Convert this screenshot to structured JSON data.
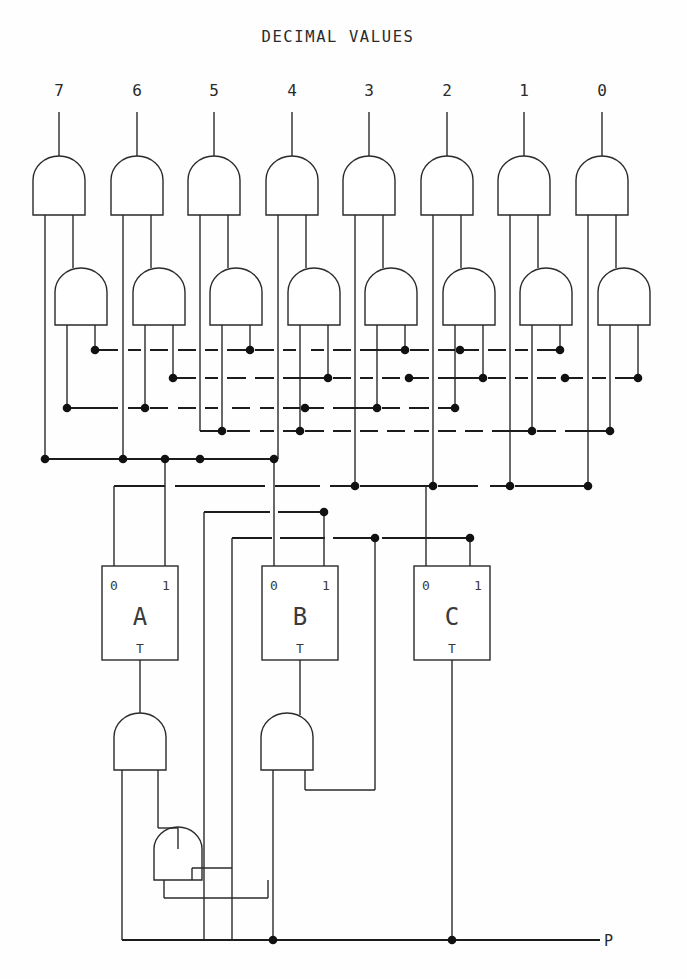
{
  "figure": {
    "title": "DECIMAL VALUES",
    "title_x": 338,
    "title_y": 42,
    "output_label": "P",
    "output_label_x": 612,
    "output_label_y": 948,
    "background": "#ffffff",
    "ink": "#2a2a2a"
  },
  "decimal_labels": [
    {
      "text": "7",
      "x": 59,
      "y": 96
    },
    {
      "text": "6",
      "x": 137,
      "y": 96
    },
    {
      "text": "5",
      "x": 214,
      "y": 96
    },
    {
      "text": "4",
      "x": 292,
      "y": 96
    },
    {
      "text": "3",
      "x": 369,
      "y": 96
    },
    {
      "text": "2",
      "x": 447,
      "y": 96
    },
    {
      "text": "1",
      "x": 524,
      "y": 96
    },
    {
      "text": "0",
      "x": 602,
      "y": 96
    }
  ],
  "top_gates": [
    {
      "name": "and-gate-decimal-7",
      "cx": 59,
      "top": 158,
      "w": 52,
      "h": 57
    },
    {
      "name": "and-gate-decimal-6",
      "cx": 137,
      "top": 158,
      "w": 52,
      "h": 57
    },
    {
      "name": "and-gate-decimal-5",
      "cx": 214,
      "top": 158,
      "w": 52,
      "h": 57
    },
    {
      "name": "and-gate-decimal-4",
      "cx": 292,
      "top": 158,
      "w": 52,
      "h": 57
    },
    {
      "name": "and-gate-decimal-3",
      "cx": 369,
      "top": 158,
      "w": 52,
      "h": 57
    },
    {
      "name": "and-gate-decimal-2",
      "cx": 447,
      "top": 158,
      "w": 52,
      "h": 57
    },
    {
      "name": "and-gate-decimal-1",
      "cx": 524,
      "top": 158,
      "w": 52,
      "h": 57
    },
    {
      "name": "and-gate-decimal-0",
      "cx": 602,
      "top": 158,
      "w": 52,
      "h": 57
    }
  ],
  "second_gates": [
    {
      "name": "and-gate-stage2-7",
      "cx": 81,
      "top": 268,
      "w": 52,
      "h": 57
    },
    {
      "name": "and-gate-stage2-6",
      "cx": 159,
      "top": 268,
      "w": 52,
      "h": 57
    },
    {
      "name": "and-gate-stage2-5",
      "cx": 236,
      "top": 268,
      "w": 52,
      "h": 57
    },
    {
      "name": "and-gate-stage2-4",
      "cx": 314,
      "top": 268,
      "w": 52,
      "h": 57
    },
    {
      "name": "and-gate-stage2-3",
      "cx": 391,
      "top": 268,
      "w": 52,
      "h": 57
    },
    {
      "name": "and-gate-stage2-2",
      "cx": 469,
      "top": 268,
      "w": 52,
      "h": 57
    },
    {
      "name": "and-gate-stage2-1",
      "cx": 546,
      "top": 268,
      "w": 52,
      "h": 57
    },
    {
      "name": "and-gate-stage2-0",
      "cx": 624,
      "top": 268,
      "w": 52,
      "h": 57
    }
  ],
  "flipflops": [
    {
      "name": "flipflop-a",
      "label": "A",
      "in0": "0",
      "in1": "1",
      "clk": "T",
      "x": 102,
      "y": 566,
      "w": 76,
      "h": 94
    },
    {
      "name": "flipflop-b",
      "label": "B",
      "in0": "0",
      "in1": "1",
      "clk": "T",
      "x": 262,
      "y": 566,
      "w": 76,
      "h": 94
    },
    {
      "name": "flipflop-c",
      "label": "C",
      "in0": "0",
      "in1": "1",
      "clk": "T",
      "x": 414,
      "y": 566,
      "w": 76,
      "h": 94
    }
  ],
  "bottom_gates": [
    {
      "name": "and-gate-output-a",
      "cx": 140,
      "top": 715,
      "w": 52,
      "h": 55
    },
    {
      "name": "and-gate-output-b",
      "cx": 287,
      "top": 715,
      "w": 52,
      "h": 55
    },
    {
      "name": "and-gate-output-feedback",
      "cx": 178,
      "top": 828,
      "w": 48,
      "h": 52
    }
  ],
  "bus_rows": [
    {
      "name": "bus-row-1",
      "y": 350
    },
    {
      "name": "bus-row-2",
      "y": 378
    },
    {
      "name": "bus-row-3",
      "y": 408
    },
    {
      "name": "bus-row-4",
      "y": 431
    },
    {
      "name": "bus-row-5",
      "y": 459
    },
    {
      "name": "bus-row-6",
      "y": 486
    },
    {
      "name": "bus-row-7",
      "y": 512
    },
    {
      "name": "bus-row-8",
      "y": 538
    },
    {
      "name": "bus-output-p",
      "y": 940
    }
  ]
}
